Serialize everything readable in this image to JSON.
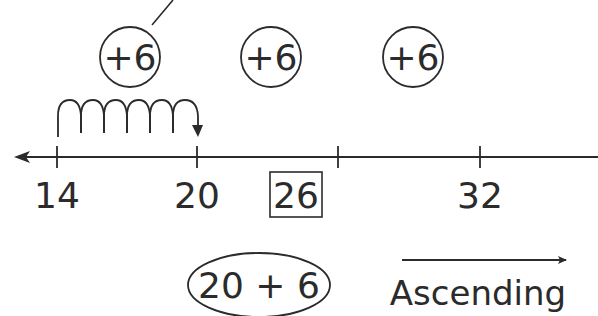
{
  "diagram": {
    "type": "number-line",
    "colors": {
      "ink": "#2b2b2b",
      "background": "#ffffff"
    },
    "step_circles": [
      {
        "label": "+6"
      },
      {
        "label": "+6"
      },
      {
        "label": "+6"
      }
    ],
    "jumps": {
      "from": "14",
      "to": "20",
      "count": 6
    },
    "number_line": {
      "ticks": [
        {
          "label": "14",
          "boxed": false
        },
        {
          "label": "20",
          "boxed": false
        },
        {
          "label": "26",
          "boxed": true
        },
        {
          "label": "32",
          "boxed": false
        }
      ],
      "left_arrow": true
    },
    "expression": {
      "text": "20 + 6"
    },
    "direction": {
      "label": "Ascending",
      "arrow": "right"
    }
  }
}
